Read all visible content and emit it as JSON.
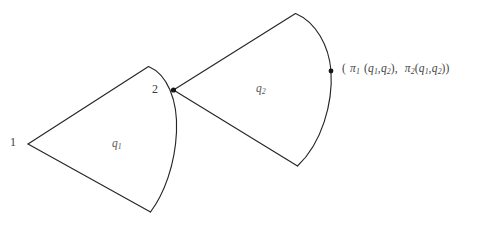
{
  "figure": {
    "background_color": "#ffffff",
    "stroke_color": "#262626",
    "vertices": [
      {
        "id": "v1",
        "label": "1",
        "x": 28,
        "y": 144,
        "has_dot": false
      },
      {
        "id": "v2",
        "label": "2",
        "x": 173,
        "y": 90,
        "has_dot": true
      },
      {
        "id": "vp",
        "label": "",
        "x": 331,
        "y": 71,
        "has_dot": true
      }
    ],
    "regions": [
      {
        "id": "left-cone",
        "label": "q",
        "subscript": "1",
        "label_x": 112,
        "label_y": 138
      },
      {
        "id": "right-cone",
        "label": "q",
        "subscript": "2",
        "label_x": 256,
        "label_y": 83
      }
    ],
    "labels": {
      "vertex_1": "1",
      "vertex_2": "2",
      "region_q1_base": "q",
      "region_q1_sub": "1",
      "region_q2_base": "q",
      "region_q2_sub": "2"
    },
    "pair_label": {
      "text": "( π1 (q1,q2) ,  π2(q1,q2))",
      "open_paren": "(",
      "pi_1": "π",
      "pi_1_sub": "1",
      "arg_open_1": "(",
      "arg_q_a1": "q",
      "arg_q_a1_sub": "1",
      "comma_1": ",",
      "arg_q_b1": "q",
      "arg_q_b1_sub": "2",
      "arg_close_1": ")",
      "mid_comma": ",",
      "pi_2": "π",
      "pi_2_sub": "2",
      "arg_open_2": "(",
      "arg_q_a2": "q",
      "arg_q_a2_sub": "1",
      "comma_2": ",",
      "arg_q_b2": "q",
      "arg_q_b2_sub": "2",
      "arg_close_2": ")",
      "close_paren": ")"
    }
  }
}
